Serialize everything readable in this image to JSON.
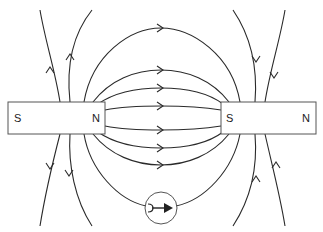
{
  "diagram": {
    "magnets": [
      {
        "name": "left-magnet",
        "left_pole": "S",
        "right_pole": "N"
      },
      {
        "name": "right-magnet",
        "left_pole": "S",
        "right_pole": "N"
      }
    ],
    "compass": {
      "direction": "right"
    },
    "colors": {
      "line": "#2a2a2a",
      "border": "#555555",
      "background": "#ffffff"
    }
  }
}
